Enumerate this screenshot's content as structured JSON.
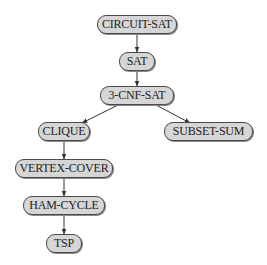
{
  "diagram": {
    "type": "reduction-tree",
    "colors": {
      "node_fill": "#d6d6d6",
      "node_border": "#4a4a4a",
      "edge": "#333333",
      "text": "#222222"
    },
    "nodes": [
      {
        "id": "circuit_sat",
        "label": "CIRCUIT-SAT",
        "x": 97,
        "y": 15,
        "w": 80
      },
      {
        "id": "sat",
        "label": "SAT",
        "x": 119,
        "y": 52,
        "w": 36
      },
      {
        "id": "cnf3",
        "label": "3-CNF-SAT",
        "x": 100,
        "y": 86,
        "w": 74
      },
      {
        "id": "clique",
        "label": "CLIQUE",
        "x": 38,
        "y": 122,
        "w": 52
      },
      {
        "id": "subset_sum",
        "label": "SUBSET-SUM",
        "x": 164,
        "y": 122,
        "w": 89
      },
      {
        "id": "vertex_cover",
        "label": "VERTEX-COVER",
        "x": 15,
        "y": 159,
        "w": 98
      },
      {
        "id": "ham_cycle",
        "label": "HAM-CYCLE",
        "x": 23,
        "y": 196,
        "w": 82
      },
      {
        "id": "tsp",
        "label": "TSP",
        "x": 46,
        "y": 234,
        "w": 36
      }
    ],
    "edges": [
      {
        "from": "circuit_sat",
        "to": "sat",
        "x1": 137,
        "y1": 34,
        "x2": 137,
        "y2": 52
      },
      {
        "from": "sat",
        "to": "cnf3",
        "x1": 137,
        "y1": 71,
        "x2": 137,
        "y2": 86
      },
      {
        "from": "cnf3",
        "to": "clique",
        "x1": 118,
        "y1": 105,
        "x2": 82,
        "y2": 123
      },
      {
        "from": "cnf3",
        "to": "subset_sum",
        "x1": 156,
        "y1": 105,
        "x2": 190,
        "y2": 123
      },
      {
        "from": "clique",
        "to": "vertex_cover",
        "x1": 64,
        "y1": 141,
        "x2": 64,
        "y2": 159
      },
      {
        "from": "vertex_cover",
        "to": "ham_cycle",
        "x1": 64,
        "y1": 178,
        "x2": 64,
        "y2": 196
      },
      {
        "from": "ham_cycle",
        "to": "tsp",
        "x1": 64,
        "y1": 215,
        "x2": 64,
        "y2": 234
      }
    ]
  }
}
